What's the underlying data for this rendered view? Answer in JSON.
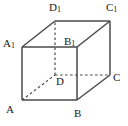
{
  "figure": {
    "type": "geometric-solid-diagram",
    "shape": "cube",
    "stroke_color": "#4a4a4a",
    "label_color": "#1a1a1a",
    "background_color": "#ffffff",
    "canvas": {
      "width": 128,
      "height": 126
    }
  },
  "vertices": [
    {
      "id": "A",
      "letter": "A",
      "subscript": "",
      "x": 22,
      "y": 100,
      "label_x": 6,
      "label_y": 104,
      "hidden": false
    },
    {
      "id": "B",
      "letter": "B",
      "subscript": "",
      "x": 77,
      "y": 100,
      "label_x": 74,
      "label_y": 108,
      "hidden": false
    },
    {
      "id": "C",
      "letter": "C",
      "subscript": "",
      "x": 110,
      "y": 75,
      "label_x": 113,
      "label_y": 72,
      "hidden": false
    },
    {
      "id": "D",
      "letter": "D",
      "subscript": "",
      "x": 55,
      "y": 75,
      "label_x": 56,
      "label_y": 76,
      "hidden": true
    },
    {
      "id": "A1",
      "letter": "A",
      "subscript": "1",
      "x": 22,
      "y": 47,
      "label_x": 3,
      "label_y": 38,
      "hidden": false
    },
    {
      "id": "B1",
      "letter": "B",
      "subscript": "1",
      "x": 77,
      "y": 47,
      "label_x": 64,
      "label_y": 36,
      "hidden": false
    },
    {
      "id": "C1",
      "letter": "C",
      "subscript": "1",
      "x": 110,
      "y": 21,
      "label_x": 106,
      "label_y": 2,
      "hidden": false
    },
    {
      "id": "D1",
      "letter": "D",
      "subscript": "1",
      "x": 55,
      "y": 21,
      "label_x": 49,
      "label_y": 2,
      "hidden": false
    }
  ],
  "edges": [
    {
      "id": "A-B",
      "from": "A",
      "to": "B",
      "style": "solid",
      "name": "edge-a-b"
    },
    {
      "id": "A-A1",
      "from": "A",
      "to": "A1",
      "style": "solid",
      "name": "edge-a-a1"
    },
    {
      "id": "B-B1",
      "from": "B",
      "to": "B1",
      "style": "solid",
      "name": "edge-b-b1"
    },
    {
      "id": "B-C",
      "from": "B",
      "to": "C",
      "style": "solid",
      "name": "edge-b-c"
    },
    {
      "id": "C-C1",
      "from": "C",
      "to": "C1",
      "style": "solid",
      "name": "edge-c-c1"
    },
    {
      "id": "A1-B1",
      "from": "A1",
      "to": "B1",
      "style": "solid",
      "name": "edge-a1-b1"
    },
    {
      "id": "A1-D1",
      "from": "A1",
      "to": "D1",
      "style": "solid",
      "name": "edge-a1-d1"
    },
    {
      "id": "B1-C1",
      "from": "B1",
      "to": "C1",
      "style": "solid",
      "name": "edge-b1-c1"
    },
    {
      "id": "D1-C1",
      "from": "D1",
      "to": "C1",
      "style": "solid",
      "name": "edge-d1-c1"
    },
    {
      "id": "D-D1",
      "from": "D",
      "to": "D1",
      "style": "dashed",
      "name": "edge-d-d1-hidden"
    },
    {
      "id": "D-C",
      "from": "D",
      "to": "C",
      "style": "dashed",
      "name": "edge-d-c-hidden"
    },
    {
      "id": "A-D",
      "from": "A",
      "to": "D",
      "style": "dashed",
      "name": "edge-a-d-hidden"
    }
  ]
}
